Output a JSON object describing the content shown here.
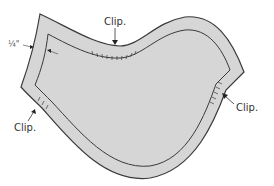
{
  "diagram": {
    "labels": {
      "clip_top": "Clip.",
      "clip_left": "Clip.",
      "clip_right": "Clip.",
      "seam_allowance": "¼\""
    },
    "colors": {
      "seam_fill": "#d6d6d6",
      "outline": "#3a3a3a",
      "interior_fill": "#ffffff",
      "speckle": "#c8c8c8",
      "text": "#333333"
    }
  }
}
